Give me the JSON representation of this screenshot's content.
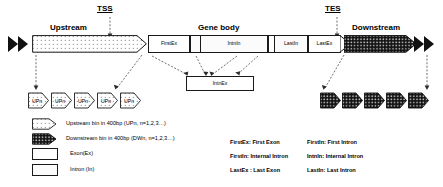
{
  "diagram": {
    "sites": {
      "tss": "TSS",
      "tes": "TES"
    },
    "regions": {
      "upstream": "Upstream",
      "gene_body": "Gene body",
      "downstream": "Downstream"
    },
    "gene_body_segments": [
      {
        "id": "first-exon",
        "label": "FirstEx",
        "type": "exon"
      },
      {
        "id": "first-intron",
        "label": "FirstIn",
        "type": "intron"
      },
      {
        "id": "internal-exon-1",
        "label": "",
        "type": "exon"
      },
      {
        "id": "internal-intron",
        "label": "IntnIn",
        "type": "intron"
      },
      {
        "id": "internal-exon-2",
        "label": "",
        "type": "exon"
      },
      {
        "id": "last-intron",
        "label": "LastIn",
        "type": "intron"
      },
      {
        "id": "last-exon",
        "label": "LastEx",
        "type": "exon"
      }
    ],
    "internal_exon_box": {
      "label": "IntnEx"
    },
    "upstream_bins": [
      {
        "label": "UPn"
      },
      {
        "label": "UPn"
      },
      {
        "label": "UPn"
      },
      {
        "label": "UPn"
      },
      {
        "label": "UPn"
      }
    ],
    "downstream_bins": [
      {
        "label": "DWn"
      },
      {
        "label": "DWn"
      },
      {
        "label": "DWn"
      },
      {
        "label": "DWn"
      },
      {
        "label": "DWn"
      }
    ]
  },
  "legend": {
    "symbols": [
      {
        "key": "upstream-bin",
        "swatch": "dotted-arrow",
        "text": "Upstream bin in 400bp (UPn, n=1,2,3…)"
      },
      {
        "key": "downstream-bin",
        "swatch": "dark-arrow",
        "text": "Downstream bin in 400bp  (DWn, n=1,2,3…)"
      },
      {
        "key": "exon",
        "swatch": "white-box",
        "text": "Exon(Ex)"
      },
      {
        "key": "intron",
        "swatch": "light-box",
        "text": "Intron (In)"
      }
    ],
    "abbreviations": [
      {
        "left": "FirstEx: First Exon",
        "right": "FirstIn: First Intron"
      },
      {
        "left": "FirstIn: Internal Intron",
        "right": "IntnIn: Internal Intron"
      },
      {
        "left": "LastEx : Last Exon",
        "right": "LastIn: Last Intron"
      }
    ]
  },
  "colors": {
    "stroke": "#1a1a1a",
    "dash": "#4a4a4a",
    "dark_fill": "#141414",
    "background": "#ffffff"
  }
}
